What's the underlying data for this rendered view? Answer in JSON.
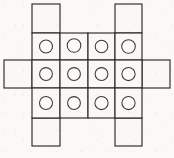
{
  "figure": {
    "kind": "grid-net-diagram",
    "title": "",
    "canvas": {
      "width": 174,
      "height": 158
    },
    "background_color": "#faf9f7",
    "line_color": "#2b2b2b",
    "cell_fill_color": "#f9f8f6",
    "hole_stroke_color": "#3a3a3a",
    "geometry": {
      "cell_width": 28,
      "cell_height": 28,
      "grid_origin_x": 32,
      "grid_origin_y": 33,
      "grid_columns": 4,
      "grid_rows": 3,
      "hole_radius": 6.5,
      "column_x": [
        4,
        32,
        60,
        88,
        115,
        142,
        170
      ],
      "row_y": [
        4,
        33,
        60,
        88,
        118,
        146
      ]
    },
    "counts": {
      "total_cells": 18,
      "center_cells": 12,
      "tab_cells": 6,
      "holes": 12
    },
    "center_cells": [
      {
        "id": "cell-r1c1",
        "row": 1,
        "col": 1,
        "x": 32,
        "y": 33,
        "w": 28,
        "h": 27,
        "has_hole": true
      },
      {
        "id": "cell-r1c2",
        "row": 1,
        "col": 2,
        "x": 60,
        "y": 33,
        "w": 28,
        "h": 27,
        "has_hole": true
      },
      {
        "id": "cell-r1c3",
        "row": 1,
        "col": 3,
        "x": 88,
        "y": 33,
        "w": 27,
        "h": 27,
        "has_hole": true
      },
      {
        "id": "cell-r1c4",
        "row": 1,
        "col": 4,
        "x": 115,
        "y": 33,
        "w": 27,
        "h": 27,
        "has_hole": true
      },
      {
        "id": "cell-r2c1",
        "row": 2,
        "col": 1,
        "x": 32,
        "y": 60,
        "w": 28,
        "h": 28,
        "has_hole": true
      },
      {
        "id": "cell-r2c2",
        "row": 2,
        "col": 2,
        "x": 60,
        "y": 60,
        "w": 28,
        "h": 28,
        "has_hole": true
      },
      {
        "id": "cell-r2c3",
        "row": 2,
        "col": 3,
        "x": 88,
        "y": 60,
        "w": 27,
        "h": 28,
        "has_hole": true
      },
      {
        "id": "cell-r2c4",
        "row": 2,
        "col": 4,
        "x": 115,
        "y": 60,
        "w": 27,
        "h": 28,
        "has_hole": true
      },
      {
        "id": "cell-r3c1",
        "row": 3,
        "col": 1,
        "x": 32,
        "y": 88,
        "w": 28,
        "h": 30,
        "has_hole": true
      },
      {
        "id": "cell-r3c2",
        "row": 3,
        "col": 2,
        "x": 60,
        "y": 88,
        "w": 28,
        "h": 30,
        "has_hole": true
      },
      {
        "id": "cell-r3c3",
        "row": 3,
        "col": 3,
        "x": 88,
        "y": 88,
        "w": 27,
        "h": 30,
        "has_hole": true
      },
      {
        "id": "cell-r3c4",
        "row": 3,
        "col": 4,
        "x": 115,
        "y": 88,
        "w": 27,
        "h": 30,
        "has_hole": true
      }
    ],
    "tab_cells": [
      {
        "id": "tab-top-left",
        "edge": "top",
        "x": 32,
        "y": 4,
        "w": 28,
        "h": 29,
        "has_hole": false
      },
      {
        "id": "tab-top-right",
        "edge": "top",
        "x": 115,
        "y": 4,
        "w": 27,
        "h": 29,
        "has_hole": false
      },
      {
        "id": "tab-left-middle",
        "edge": "left",
        "x": 4,
        "y": 60,
        "w": 28,
        "h": 28,
        "has_hole": false
      },
      {
        "id": "tab-right-middle",
        "edge": "right",
        "x": 142,
        "y": 60,
        "w": 28,
        "h": 28,
        "has_hole": false
      },
      {
        "id": "tab-bottom-left",
        "edge": "bottom",
        "x": 32,
        "y": 118,
        "w": 28,
        "h": 28,
        "has_hole": false
      },
      {
        "id": "tab-bottom-right",
        "edge": "bottom",
        "x": 115,
        "y": 118,
        "w": 27,
        "h": 28,
        "has_hole": false
      }
    ],
    "holes": [
      {
        "id": "hole-r1c1",
        "cx": 46,
        "cy": 46.5,
        "r": 6.5
      },
      {
        "id": "hole-r1c2",
        "cx": 74,
        "cy": 45.5,
        "r": 6.8
      },
      {
        "id": "hole-r1c3",
        "cx": 101.5,
        "cy": 46.5,
        "r": 6.3
      },
      {
        "id": "hole-r1c4",
        "cx": 128.5,
        "cy": 46.5,
        "r": 6.8
      },
      {
        "id": "hole-r2c1",
        "cx": 46,
        "cy": 74,
        "r": 6.4
      },
      {
        "id": "hole-r2c2",
        "cx": 74,
        "cy": 74,
        "r": 6.4
      },
      {
        "id": "hole-r2c3",
        "cx": 101.5,
        "cy": 74,
        "r": 6.4
      },
      {
        "id": "hole-r2c4",
        "cx": 128.5,
        "cy": 74,
        "r": 6.6
      },
      {
        "id": "hole-r3c1",
        "cx": 46,
        "cy": 103,
        "r": 6.5
      },
      {
        "id": "hole-r3c2",
        "cx": 74,
        "cy": 103,
        "r": 6.4
      },
      {
        "id": "hole-r3c3",
        "cx": 101.5,
        "cy": 103,
        "r": 6.6
      },
      {
        "id": "hole-r3c4",
        "cx": 128.5,
        "cy": 103,
        "r": 6.6
      }
    ]
  }
}
